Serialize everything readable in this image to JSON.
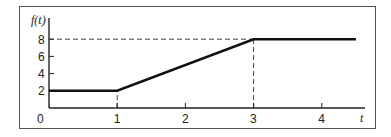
{
  "chart_data": {
    "type": "line",
    "title": "",
    "xlabel": "t",
    "ylabel": "f(t)",
    "xlim": [
      0,
      4.5
    ],
    "ylim": [
      0,
      9.5
    ],
    "x_ticks": [
      0,
      1,
      2,
      3,
      4
    ],
    "x_tick_labels": [
      "0",
      "1",
      "2",
      "3",
      "4"
    ],
    "y_ticks": [
      2,
      4,
      6,
      8
    ],
    "y_tick_labels": [
      "2",
      "4",
      "6",
      "8"
    ],
    "grid": false,
    "legend": null,
    "series": [
      {
        "name": "f(t)",
        "x": [
          0,
          1,
          3,
          4.5
        ],
        "y": [
          2,
          2,
          8,
          8
        ],
        "color": "#111111"
      }
    ],
    "annotations": [
      {
        "type": "dashed-vertical",
        "x": 1,
        "from_y": 0,
        "to_y": 2
      },
      {
        "type": "dashed-vertical",
        "x": 3,
        "from_y": 0,
        "to_y": 8
      },
      {
        "type": "dashed-horizontal",
        "y": 8,
        "from_x": 0,
        "to_x": 3
      }
    ]
  },
  "colors": {
    "line": "#111111",
    "axis": "#222222",
    "frame": "#555555",
    "dashed": "#444444",
    "background": "#ffffff"
  }
}
